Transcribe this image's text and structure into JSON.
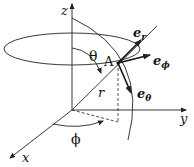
{
  "diagram": {
    "axes": {
      "x": "x",
      "y": "y",
      "z": "z"
    },
    "point_label": "A",
    "radius_label": "r",
    "theta_label": "θ",
    "phi_label": "ϕ",
    "unit_vectors": {
      "er": {
        "base": "e",
        "sub": "r"
      },
      "ephi": {
        "base": "e",
        "sub": "ϕ"
      },
      "etheta": {
        "base": "e",
        "sub": "θ"
      }
    },
    "colors": {
      "line": "#222222",
      "background": "#ffffff"
    }
  }
}
